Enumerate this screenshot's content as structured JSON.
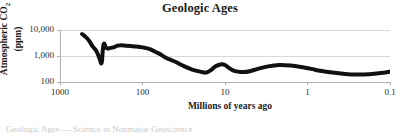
{
  "chart_data": {
    "type": "line",
    "title": "Geologic Ages",
    "xlabel": "Millions of years ago",
    "ylabel_line1": "Atmospheric CO",
    "ylabel_sub": "2",
    "ylabel_line2": "(ppm)",
    "xscale": "log",
    "yscale": "log",
    "x_reversed": true,
    "xlim": [
      1000,
      0.1
    ],
    "ylim": [
      100,
      10000
    ],
    "xticks": [
      "1000",
      "100",
      "10",
      "1",
      "0.1"
    ],
    "xtick_values": [
      1000,
      100,
      10,
      1,
      0.1
    ],
    "yticks": [
      "10,000",
      "1,000",
      "100"
    ],
    "ytick_values": [
      10000,
      1000,
      100
    ],
    "grid": "horizontal",
    "legend": "none",
    "series": [
      {
        "name": "Atmospheric CO2",
        "line_color": "#111111",
        "line_width": 4,
        "x": [
          540,
          500,
          470,
          440,
          420,
          400,
          380,
          360,
          345,
          330,
          320,
          315,
          310,
          305,
          300,
          295,
          290,
          285,
          280,
          270,
          260,
          250,
          235,
          220,
          200,
          180,
          160,
          140,
          120,
          100,
          90,
          80,
          70,
          60,
          55,
          50,
          45,
          40,
          35,
          30,
          25,
          20,
          17,
          15,
          13,
          11,
          10,
          9,
          8,
          7,
          6,
          5,
          4,
          3,
          2.2,
          1.6,
          1.2,
          0.9,
          0.7,
          0.5,
          0.35,
          0.25,
          0.18,
          0.13,
          0.1
        ],
        "y": [
          7000,
          5800,
          4800,
          3700,
          2900,
          2300,
          1900,
          1500,
          1100,
          760,
          560,
          520,
          620,
          1300,
          2200,
          2900,
          3000,
          2600,
          2200,
          2000,
          1950,
          2000,
          2100,
          2200,
          2500,
          2600,
          2500,
          2400,
          2300,
          2150,
          2000,
          1800,
          1450,
          1150,
          950,
          800,
          700,
          600,
          480,
          380,
          300,
          250,
          230,
          280,
          400,
          480,
          450,
          350,
          280,
          250,
          240,
          260,
          320,
          400,
          450,
          430,
          380,
          320,
          270,
          230,
          205,
          195,
          200,
          220,
          250
        ]
      }
    ],
    "annotations": []
  },
  "colors": {
    "background": "#ffffff",
    "plot_background": "#ffffff",
    "grid": "#d9d9d9",
    "axis": "#b0b0b0",
    "line": "#111111",
    "text": "#1a1a1a"
  },
  "caption": {
    "cutoff_text": "Geologic Ages — Science in Nonmajor Geoscience"
  }
}
